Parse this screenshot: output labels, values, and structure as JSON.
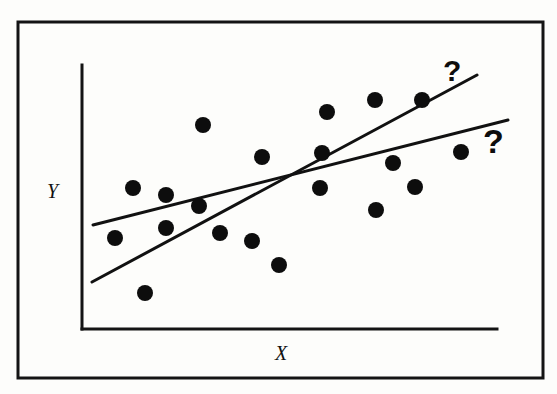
{
  "figure": {
    "kind": "scatter-with-two-regression-lines",
    "background_color": "#fdfdfb",
    "ink_color": "#111111",
    "labels": {
      "y_axis": "Y",
      "x_axis": "X",
      "annotation_upper": "?",
      "annotation_lower": "?"
    },
    "frame": {
      "x": 18,
      "y": 22,
      "width": 525,
      "height": 356,
      "stroke_width": 3
    },
    "axes": {
      "y_axis_line": {
        "x1": 82,
        "y1": 65,
        "x2": 82,
        "y2": 329
      },
      "x_axis_line": {
        "x1": 82,
        "y1": 329,
        "x2": 497,
        "y2": 329
      },
      "stroke_width": 3
    }
  },
  "chart_data": {
    "type": "scatter",
    "title": "",
    "xlabel": "X",
    "ylabel": "Y",
    "xlim": [
      0,
      100
    ],
    "ylim": [
      0,
      100
    ],
    "grid": false,
    "legend": false,
    "axis_ticks": {
      "x": [],
      "y": []
    },
    "point_radius_px": 8,
    "point_color": "#0d0d0d",
    "points": [
      {
        "px": 203,
        "py": 125
      },
      {
        "px": 115,
        "py": 238
      },
      {
        "px": 133,
        "py": 188
      },
      {
        "px": 145,
        "py": 293
      },
      {
        "px": 166,
        "py": 195
      },
      {
        "px": 166,
        "py": 228
      },
      {
        "px": 199,
        "py": 206
      },
      {
        "px": 220,
        "py": 233
      },
      {
        "px": 252,
        "py": 241
      },
      {
        "px": 262,
        "py": 157
      },
      {
        "px": 279,
        "py": 265
      },
      {
        "px": 320,
        "py": 188
      },
      {
        "px": 322,
        "py": 153
      },
      {
        "px": 327,
        "py": 112
      },
      {
        "px": 375,
        "py": 100
      },
      {
        "px": 376,
        "py": 210
      },
      {
        "px": 393,
        "py": 163
      },
      {
        "px": 415,
        "py": 187
      },
      {
        "px": 422,
        "py": 100
      },
      {
        "px": 461,
        "py": 152
      }
    ],
    "series": [
      {
        "name": "shallow-fit-line",
        "type": "line",
        "annotation": "?",
        "endpoints_px": {
          "x1": 93,
          "y1": 225,
          "x2": 508,
          "y2": 120
        },
        "stroke_width": 3
      },
      {
        "name": "steep-fit-line",
        "type": "line",
        "annotation": "?",
        "endpoints_px": {
          "x1": 92,
          "y1": 282,
          "x2": 477,
          "y2": 75
        },
        "stroke_width": 3
      }
    ]
  }
}
